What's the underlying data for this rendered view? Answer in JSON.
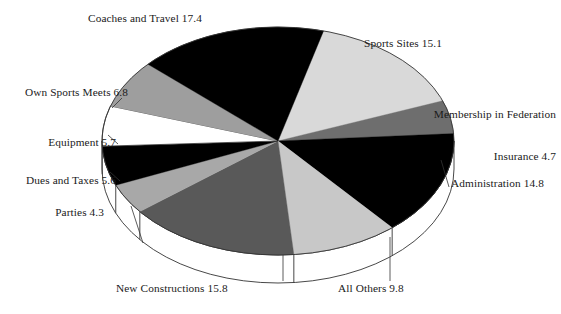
{
  "chart_data": {
    "type": "pie",
    "title": "",
    "subtitle": "",
    "xlabel": "",
    "ylabel": "",
    "grid": false,
    "legend_position": "none",
    "label_format": "name value",
    "total": 100.0,
    "units": "percent",
    "style": "3d-pie-with-depth",
    "start_angle_deg": -75,
    "direction": "clockwise",
    "categories": [
      "Sports Sites",
      "Membership in Federation Insurance",
      "Administration",
      "All Others",
      "New Constructions",
      "Parties",
      "Dues and Taxes",
      "Equipment",
      "Own Sports Meets",
      "Coaches and Travel"
    ],
    "values": [
      15.1,
      4.7,
      14.8,
      9.8,
      15.8,
      4.3,
      5.6,
      5.7,
      6.8,
      17.4
    ],
    "slices": [
      {
        "name": "Sports Sites",
        "value": 15.1,
        "label": "Sports Sites 15.1",
        "color": "#d9d9d9",
        "leader": false
      },
      {
        "name": "Membership in Federation Insurance",
        "value": 4.7,
        "label": "Membership in Federation\nInsurance 4.7",
        "color": "#6e6e6e",
        "leader": false
      },
      {
        "name": "Administration",
        "value": 14.8,
        "label": "Administration 14.8",
        "color": "#000000",
        "leader": true
      },
      {
        "name": "All Others",
        "value": 9.8,
        "label": "All Others 9.8",
        "color": "#c8c8c8",
        "leader": true
      },
      {
        "name": "New Constructions",
        "value": 15.8,
        "label": "New Constructions 15.8",
        "color": "#595959",
        "leader": true
      },
      {
        "name": "Parties",
        "value": 4.3,
        "label": "Parties 4.3",
        "color": "#a8a8a8",
        "leader": true
      },
      {
        "name": "Dues and Taxes",
        "value": 5.6,
        "label": "Dues and Taxes 5.6",
        "color": "#000000",
        "leader": true
      },
      {
        "name": "Equipment",
        "value": 5.7,
        "label": "Equipment 5.7",
        "color": "#ffffff",
        "leader": true
      },
      {
        "name": "Own Sports Meets",
        "value": 6.8,
        "label": "Own Sports Meets 6.8",
        "color": "#9e9e9e",
        "leader": false
      },
      {
        "name": "Coaches and Travel",
        "value": 17.4,
        "label": "Coaches and Travel 17.4",
        "color": "#000000",
        "leader": false
      }
    ]
  },
  "labels": {
    "sports_sites": "Sports Sites 15.1",
    "membership_line1": "Membership in Federation",
    "membership_line2": "Insurance 4.7",
    "administration": "Administration 14.8",
    "all_others": "All Others 9.8",
    "new_constructions": "New Constructions 15.8",
    "parties": "Parties 4.3",
    "dues_and_taxes": "Dues and Taxes 5.6",
    "equipment": "Equipment 5.7",
    "own_sports_meets": "Own Sports Meets 6.8",
    "coaches_and_travel": "Coaches and Travel 17.4"
  },
  "colors": {
    "background": "#ffffff",
    "outline": "#333333",
    "text": "#1a1a1a"
  },
  "geometry": {
    "center_x": 278,
    "center_y": 141,
    "radius_x": 176,
    "radius_y": 114,
    "depth": 28
  }
}
